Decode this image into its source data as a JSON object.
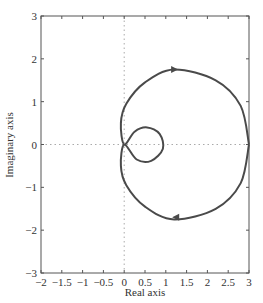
{
  "chart_data": {
    "type": "line",
    "title": "",
    "xlabel": "Real axis",
    "ylabel": "Imaginary axis",
    "xlim": [
      -2,
      3
    ],
    "ylim": [
      -3,
      3
    ],
    "xticks": [
      -2,
      -1.5,
      -1,
      -0.5,
      0,
      0.5,
      1,
      1.5,
      2,
      2.5,
      3
    ],
    "xtick_labels": [
      "-2",
      "-1.5",
      "-1",
      "-0.5",
      "0",
      "0.5",
      "1",
      "1.5",
      "2",
      "2.5",
      "3"
    ],
    "yticks": [
      -3,
      -2,
      -1,
      0,
      1,
      2,
      3
    ],
    "ytick_labels": [
      "-3",
      "-2",
      "-1",
      "0",
      "1",
      "2",
      "3"
    ],
    "grid": false,
    "reference_lines": [
      "dotted x=0",
      "dotted y=0"
    ],
    "legend": null,
    "series": [
      {
        "name": "Nyquist curve",
        "color": "#4a4a4a",
        "x": [
          3,
          2.8,
          2.2,
          1.2,
          0.5,
          0.05,
          -0.08,
          0,
          0.3,
          0.65,
          0.93,
          0.85,
          0.55,
          0.25,
          0,
          -0.08,
          0.05,
          0.5,
          1.2,
          2.2,
          2.8,
          3
        ],
        "y": [
          0,
          -0.9,
          -1.5,
          -1.75,
          -1.45,
          -0.95,
          -0.5,
          0,
          -0.35,
          -0.38,
          -0.1,
          0.25,
          0.4,
          0.3,
          0,
          0.5,
          0.95,
          1.45,
          1.75,
          1.5,
          0.9,
          0
        ]
      }
    ],
    "annotations": [
      {
        "type": "arrow",
        "x": 1.2,
        "y": 1.75,
        "direction": "right"
      },
      {
        "type": "arrow",
        "x": 1.25,
        "y": -1.7,
        "direction": "left"
      }
    ]
  },
  "axes": {
    "x_title": "Real axis",
    "y_title": "Imaginary axis"
  }
}
